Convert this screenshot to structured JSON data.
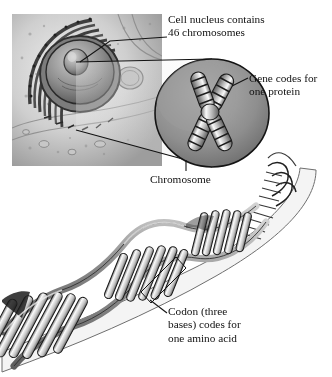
{
  "figure": {
    "style": "grayscale scientific illustration",
    "background_color": "#ffffff"
  },
  "labels": {
    "nucleus": "Cell nucleus contains\n46 chromosomes",
    "gene": "Gene codes for\none protein",
    "chromosome": "Chromosome",
    "codon": "Codon (three\nbases) codes for\none amino acid"
  },
  "diagram_parts": [
    {
      "name": "cell",
      "description": "cut-away animal cell with nucleus and rough endoplasmic reticulum"
    },
    {
      "name": "magnifier-cone",
      "description": "wedge expanding from nucleus to chromosome ellipse"
    },
    {
      "name": "chromosome-ellipse",
      "description": "oval field containing X-shaped banded chromosome"
    },
    {
      "name": "dna-helix",
      "description": "double helix unwinding toward lower left with base-pair rungs"
    },
    {
      "name": "codon-bracket",
      "description": "bracket marking three adjacent base pairs"
    }
  ],
  "colors": {
    "ink": "#111111",
    "outline": "#2b2b2b",
    "cell_light": "#d8d8d8",
    "cell_mid": "#a9a9a9",
    "cell_dark": "#6e6e6e",
    "ellipse_fill": "#8f8f8f",
    "helix_ribbon": "#8a8a8a",
    "rung_light": "#f2f2f2",
    "cone_fill": "#ececec"
  }
}
